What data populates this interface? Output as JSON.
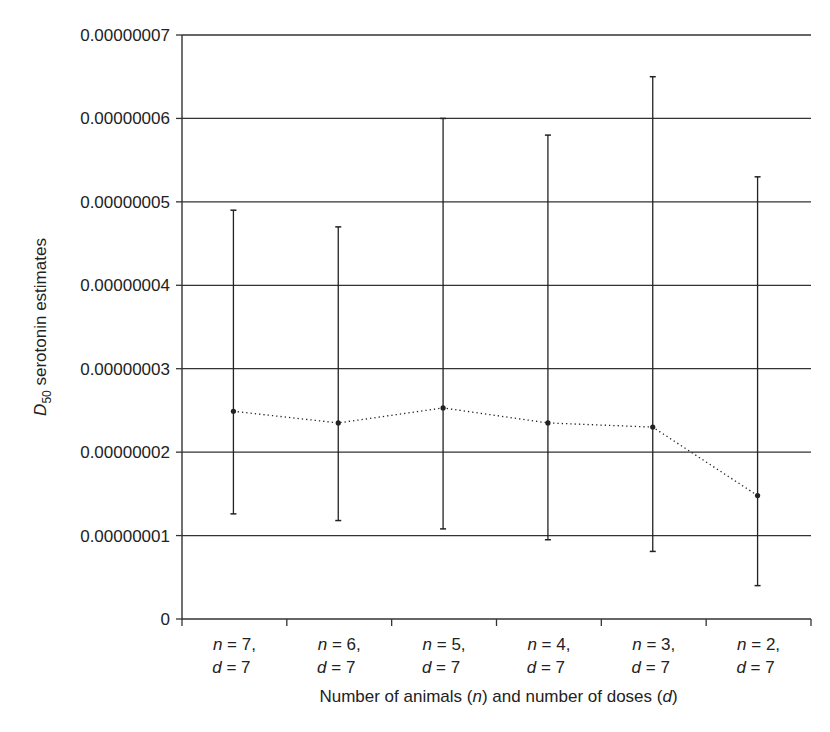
{
  "chart_data": {
    "type": "scatter",
    "subtype": "mean-with-error-bars",
    "title": "",
    "xlabel": "Number of animals (n) and number of doses (d)",
    "ylabel": "D50 serotonin estimates",
    "ylabel_parts": {
      "main": "D",
      "subscript": "50",
      "rest": " serotonin estimates"
    },
    "xlabel_parts": [
      {
        "text": "Number of animals (",
        "italic": false
      },
      {
        "text": "n",
        "italic": true
      },
      {
        "text": ") and number of doses (",
        "italic": false
      },
      {
        "text": "d",
        "italic": true
      },
      {
        "text": ")",
        "italic": false
      }
    ],
    "ylim": [
      0,
      7e-08
    ],
    "yticks": [
      0,
      1e-08,
      2e-08,
      3e-08,
      4e-08,
      5e-08,
      6e-08,
      7e-08
    ],
    "ytick_labels": [
      "0",
      "0.00000001",
      "0.00000002",
      "0.00000003",
      "0.00000004",
      "0.00000005",
      "0.00000006",
      "0.00000007"
    ],
    "grid": {
      "horizontal": true,
      "vertical": false
    },
    "legend": null,
    "categories": [
      "n = 7, d = 7",
      "n = 6, d = 7",
      "n = 5, d = 7",
      "n = 4, d = 7",
      "n = 3, d = 7",
      "n = 2, d = 7"
    ],
    "category_lines": [
      {
        "line1_var": "n",
        "line1_val": " = 7,",
        "line2_var": "d",
        "line2_val": " = 7"
      },
      {
        "line1_var": "n",
        "line1_val": " = 6,",
        "line2_var": "d",
        "line2_val": " = 7"
      },
      {
        "line1_var": "n",
        "line1_val": " = 5,",
        "line2_var": "d",
        "line2_val": " = 7"
      },
      {
        "line1_var": "n",
        "line1_val": " = 4,",
        "line2_var": "d",
        "line2_val": " = 7"
      },
      {
        "line1_var": "n",
        "line1_val": " = 3,",
        "line2_var": "d",
        "line2_val": " = 7"
      },
      {
        "line1_var": "n",
        "line1_val": " = 2,",
        "line2_var": "d",
        "line2_val": " = 7"
      }
    ],
    "series": [
      {
        "name": "D50 serotonin estimate",
        "line_style": "dotted",
        "values": [
          2.49e-08,
          2.35e-08,
          2.53e-08,
          2.35e-08,
          2.3e-08,
          1.48e-08
        ],
        "error_upper": [
          4.9e-08,
          4.7e-08,
          6e-08,
          5.8e-08,
          6.5e-08,
          5.3e-08
        ],
        "error_lower": [
          1.26e-08,
          1.18e-08,
          1.08e-08,
          9.5e-09,
          8.1e-09,
          4e-09
        ]
      }
    ]
  },
  "colors": {
    "axis": "#333333",
    "grid": "#333333",
    "series": "#222222",
    "text": "#222222",
    "background": "#ffffff"
  }
}
